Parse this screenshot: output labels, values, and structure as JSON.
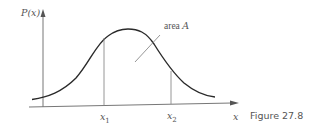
{
  "figure": {
    "caption": "Figure 27.8",
    "y_axis_label": "P(x)",
    "x_axis_label": "x",
    "area_label": "area A",
    "markers": [
      {
        "label": "x1",
        "display_base": "x",
        "display_sub": "1"
      },
      {
        "label": "x2",
        "display_base": "x",
        "display_sub": "2"
      }
    ],
    "curve": "bell-shaped probability density curve P(x)",
    "shaded_region": "area A between x1 and x2 under the curve"
  },
  "colors": {
    "curve": "#2a2a2a",
    "axes": "#777777",
    "guides": "#8a8a8a",
    "text": "#555555"
  }
}
